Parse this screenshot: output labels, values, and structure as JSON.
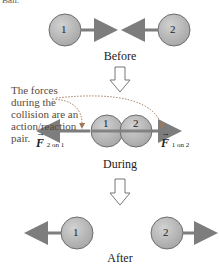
{
  "header_fragment": "Ball.",
  "stages": {
    "before": "Before",
    "during": "During",
    "after": "After"
  },
  "balls": {
    "one": "1",
    "two": "2"
  },
  "annotation": [
    "The forces",
    "during the",
    "collision are an",
    "action/reaction",
    "pair."
  ],
  "forces": {
    "left": {
      "symbol": "F",
      "subscript": "2 on 1"
    },
    "right": {
      "symbol": "F",
      "subscript": "1 on 2"
    }
  },
  "colors": {
    "ball_fill": "#b4b4b4",
    "ball_stroke": "#6e6e6e",
    "arrow": "#7d7d7d",
    "dotted": "#a0785a"
  }
}
